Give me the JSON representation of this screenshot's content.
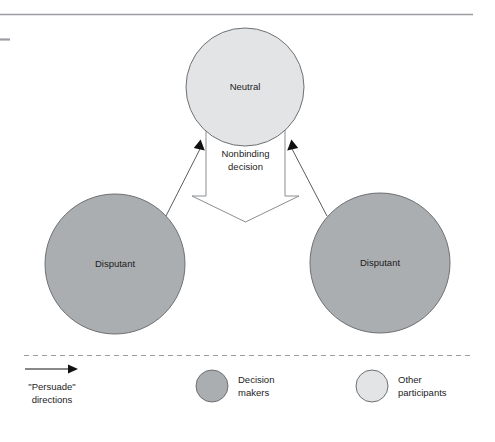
{
  "figure": {
    "title": "",
    "background": "#ffffff",
    "top_rule": {
      "color": "#9a9da1",
      "x1": 0,
      "x2": 473,
      "y": 14
    },
    "left_tick": {
      "color": "#9a9da1",
      "x1": 0,
      "x2": 10,
      "y": 39
    }
  },
  "colors": {
    "decision_maker_fill": "#abaeb1",
    "other_participant_fill": "#e2e4e5",
    "node_stroke": "#6e7174",
    "arrow_stroke": "#5a5d60",
    "arrowhead_fill": "#111111",
    "block_fill": "#ffffff",
    "block_stroke": "#8a8d90",
    "dashed_rule": "#9a9da1",
    "text": "#1c1c1c"
  },
  "nodes": [
    {
      "id": "neutral",
      "label": "Neutral",
      "role": "other-participant",
      "cx": 245,
      "cy": 87,
      "r": 59
    },
    {
      "id": "disputant-left",
      "label": "Disputant",
      "role": "decision-maker",
      "cx": 115,
      "cy": 264,
      "r": 70
    },
    {
      "id": "disputant-right",
      "label": "Disputant",
      "role": "decision-maker",
      "cx": 380,
      "cy": 263,
      "r": 70
    }
  ],
  "flow_block": {
    "label_line1": "Nonbinding",
    "label_line2": "decision",
    "direction": "down"
  },
  "arrows": [
    {
      "id": "persuade-left",
      "from": "disputant-left",
      "to": "neutral",
      "description": "left disputant persuades neutral"
    },
    {
      "id": "persuade-right",
      "from": "disputant-right",
      "to": "neutral",
      "description": "right disputant persuades neutral"
    }
  ],
  "legend": {
    "items": [
      {
        "id": "persuade-directions",
        "symbol": "arrow-right-icon",
        "line1": "\"Persuade\"",
        "line2": "directions"
      },
      {
        "id": "decision-makers",
        "symbol": "circle-icon",
        "fill": "#abaeb1",
        "line1": "Decision",
        "line2": "makers"
      },
      {
        "id": "other-participants",
        "symbol": "circle-icon",
        "fill": "#e2e4e5",
        "line1": "Other",
        "line2": "participants"
      }
    ]
  }
}
